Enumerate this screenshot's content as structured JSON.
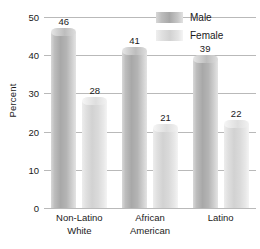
{
  "chart_data": {
    "type": "bar",
    "title": "",
    "xlabel": "",
    "ylabel": "Percent",
    "ylim": [
      0,
      50
    ],
    "yticks": [
      0,
      10,
      20,
      30,
      40,
      50
    ],
    "ytick_labels": [
      "0",
      "10",
      "20",
      "30",
      "40",
      "50"
    ],
    "grid": true,
    "legend_position": "top-right",
    "categories": [
      "Non-Latino White",
      "African American",
      "Latino"
    ],
    "category_lines": [
      [
        "Non-Latino",
        "White"
      ],
      [
        "African",
        "American"
      ],
      [
        "Latino",
        ""
      ]
    ],
    "series": [
      {
        "name": "Male",
        "color": "#b0b0b0",
        "values": [
          46,
          41,
          39
        ],
        "value_labels": [
          "46",
          "41",
          "39"
        ]
      },
      {
        "name": "Female",
        "color": "#dedede",
        "values": [
          28,
          21,
          22
        ],
        "value_labels": [
          "28",
          "21",
          "22"
        ]
      }
    ]
  },
  "colors": {
    "gridline": "#b9b9b9",
    "text": "#1a1a1a",
    "background": "#ffffff"
  }
}
